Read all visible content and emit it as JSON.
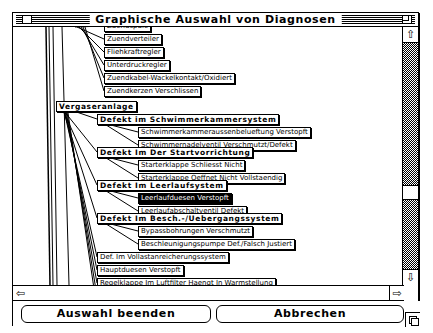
{
  "window": {
    "title": "Graphische Auswahl von Diagnosen"
  },
  "tree": {
    "nodes": [
      {
        "id": "n0",
        "label": "Zuendspule",
        "x": 91,
        "y": -6,
        "style": "normal"
      },
      {
        "id": "n1",
        "label": "Zuendverteiler",
        "x": 91,
        "y": 7,
        "style": "normal"
      },
      {
        "id": "n2",
        "label": "Fliehkraftregler",
        "x": 91,
        "y": 20,
        "style": "normal"
      },
      {
        "id": "n3",
        "label": "Unterdruckregler",
        "x": 91,
        "y": 33,
        "style": "normal"
      },
      {
        "id": "n4",
        "label": "Zuendkabel-Wackelkontakt/Oxidiert",
        "x": 91,
        "y": 46,
        "style": "normal"
      },
      {
        "id": "n5",
        "label": "Zuendkerzen Verschlissen",
        "x": 91,
        "y": 59,
        "style": "normal"
      },
      {
        "id": "n6",
        "label": "Vergaseranlage",
        "x": 43,
        "y": 74,
        "style": "bold"
      },
      {
        "id": "n7",
        "label": "Defekt im Schwimmerkammersystem",
        "x": 84,
        "y": 87,
        "style": "bold"
      },
      {
        "id": "n8",
        "label": "Schwimmerkammeraussenbelueftung Verstopft",
        "x": 125,
        "y": 100,
        "style": "normal"
      },
      {
        "id": "n9",
        "label": "Schwimmernadelventil Verschmutzt/Defekt",
        "x": 125,
        "y": 113,
        "style": "normal"
      },
      {
        "id": "n10",
        "label": "Defekt Im Der Startvorrichtung",
        "x": 84,
        "y": 120,
        "style": "bold"
      },
      {
        "id": "n11",
        "label": "Starterklappe Schliesst Nicht",
        "x": 125,
        "y": 133,
        "style": "normal"
      },
      {
        "id": "n12",
        "label": "Starterklappe Oeffnet Nicht Vollstaendig",
        "x": 125,
        "y": 146,
        "style": "normal"
      },
      {
        "id": "n13",
        "label": "Defekt Im Leerlaufsystem",
        "x": 84,
        "y": 153,
        "style": "bold"
      },
      {
        "id": "n14",
        "label": "Leerlaufduesen Verstopft",
        "x": 125,
        "y": 166,
        "style": "selected"
      },
      {
        "id": "n15",
        "label": "Leerlaufabschaltventil Defekt",
        "x": 125,
        "y": 179,
        "style": "normal"
      },
      {
        "id": "n16",
        "label": "Defekt Im Besch.-/Uebergangssystem",
        "x": 84,
        "y": 186,
        "style": "bold"
      },
      {
        "id": "n17",
        "label": "Bypassbohrungen Verschmutzt",
        "x": 125,
        "y": 199,
        "style": "normal"
      },
      {
        "id": "n18",
        "label": "Beschleunigungspumpe Def./Falsch Justiert",
        "x": 125,
        "y": 212,
        "style": "normal"
      },
      {
        "id": "n19",
        "label": "Def. Im Vollastanreicherungssystem",
        "x": 84,
        "y": 225,
        "style": "normal"
      },
      {
        "id": "n20",
        "label": "Hauptduesen Verstopft",
        "x": 84,
        "y": 238,
        "style": "normal"
      },
      {
        "id": "n21",
        "label": "Regelklappe Im Luftfilter Haengt In Warmstellung",
        "x": 84,
        "y": 251,
        "style": "normal"
      },
      {
        "id": "n22",
        "label": "Regelklappe Im Luftfilter Haengt In Kaltstellung",
        "x": 84,
        "y": 264,
        "style": "normal"
      },
      {
        "id": "n23",
        "label": "Luftfiltereinsatz Verschmutzt",
        "x": 84,
        "y": 277,
        "style": "selected"
      }
    ]
  },
  "buttons": {
    "finish": "Auswahl beenden",
    "cancel": "Abbrechen"
  },
  "icons": {
    "up": "⇧",
    "down": "⇩",
    "left": "⇦",
    "right": "⇨"
  }
}
